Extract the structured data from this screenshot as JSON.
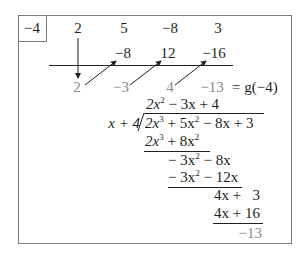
{
  "synthetic_division": {
    "divisor": "−4",
    "coefficients": [
      "2",
      "5",
      "−8",
      "3"
    ],
    "products": [
      "−8",
      "12",
      "−16"
    ],
    "results": [
      "2",
      "−3",
      "4",
      "−13"
    ],
    "result_label": "= g(−4)"
  },
  "long_division": {
    "quotient": {
      "a": "2x",
      "a_exp": "2",
      "b": " − 3x + 4"
    },
    "divisor": "x + 4",
    "dividend": {
      "a": "2x",
      "a_exp": "3",
      "b": " + 5x",
      "b_exp": "2",
      "c": " − 8x + 3"
    },
    "step1": {
      "a": "2x",
      "a_exp": "3",
      "b": " + 8x",
      "b_exp": "2"
    },
    "rem1": {
      "a": "− 3x",
      "a_exp": "2",
      "b": " − 8x"
    },
    "step2": {
      "a": "− 3x",
      "a_exp": "2",
      "b": " − 12x"
    },
    "rem2": "4x +   3",
    "step3": "4x + 16",
    "remainder": "−13"
  }
}
